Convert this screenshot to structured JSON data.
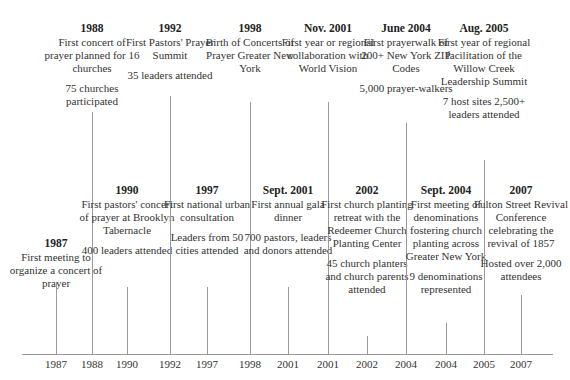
{
  "timeline": {
    "events": [
      {
        "row": "bottom",
        "x": 56,
        "top": 237,
        "year": "1987",
        "desc": "First meeting to organize a concert of prayer",
        "stat": "",
        "line_top": 283,
        "axis_label": "1987"
      },
      {
        "row": "top",
        "x": 92,
        "top": 22,
        "year": "1988",
        "desc": "First concert of prayer planned for 16 churches",
        "stat": "75 churches participated",
        "line_top": 112,
        "axis_label": "1988"
      },
      {
        "row": "bottom",
        "x": 127,
        "top": 184,
        "year": "1990",
        "desc": "First pastors' concert of prayer at Brooklyn Tabernacle",
        "stat": "400 leaders attended",
        "line_top": 287,
        "axis_label": "1990"
      },
      {
        "row": "top",
        "x": 170,
        "top": 22,
        "year": "1992",
        "desc": "First Pastors' Prayer Summit",
        "stat": "35 leaders attended",
        "line_top": 96,
        "axis_label": "1992"
      },
      {
        "row": "bottom",
        "x": 207,
        "top": 184,
        "year": "1997",
        "desc": "First national urban consultation",
        "stat": "Leaders from 50 cities attended",
        "line_top": 287,
        "axis_label": "1997"
      },
      {
        "row": "top",
        "x": 250,
        "top": 22,
        "year": "1998",
        "desc": "Birth of Concerts of Prayer Greater New York",
        "stat": "",
        "line_top": 102,
        "axis_label": "1998"
      },
      {
        "row": "bottom",
        "x": 288,
        "top": 184,
        "year": "Sept. 2001",
        "desc": "First annual gala dinner",
        "stat": "700 pastors, leaders and donors attended",
        "line_top": 287,
        "axis_label": "2001"
      },
      {
        "row": "top",
        "x": 328,
        "top": 22,
        "year": "Nov. 2001",
        "desc": "First year or regional collaboration with World Vision",
        "stat": "",
        "line_top": 102,
        "axis_label": "2001"
      },
      {
        "row": "bottom",
        "x": 367,
        "top": 184,
        "year": "2002",
        "desc": "First church planting retreat with the Redeemer Church Planting Center",
        "stat": "45 church planters and church parents attended",
        "line_top": 336,
        "axis_label": "2002"
      },
      {
        "row": "top",
        "x": 406,
        "top": 22,
        "year": "June 2004",
        "desc": "First prayerwalk of 200+ New York ZIP Codes",
        "stat": "5,000 prayer-walkers",
        "line_top": 123,
        "axis_label": "2004"
      },
      {
        "row": "bottom",
        "x": 446,
        "top": 184,
        "year": "Sept. 2004",
        "desc": "First meeting of denominations fostering church planting across Greater New York",
        "stat": "9 denominations represented",
        "line_top": 323,
        "axis_label": "2004"
      },
      {
        "row": "top",
        "x": 484,
        "top": 22,
        "year": "Aug. 2005",
        "desc": "First year of regional facilitation of the Willow Creek Leadership Summit",
        "stat": "7 host sites 2,500+ leaders attended",
        "line_top": 160,
        "axis_label": "2005"
      },
      {
        "row": "bottom",
        "x": 521,
        "top": 184,
        "year": "2007",
        "desc": "Fulton Street Revival Conference celebrating the revival of 1857",
        "stat": "Hosted over 2,000 attendees",
        "line_top": 295,
        "axis_label": "2007"
      }
    ]
  },
  "colors": {
    "line": "#9a9a9a",
    "text": "#333333",
    "background": "#ffffff"
  }
}
